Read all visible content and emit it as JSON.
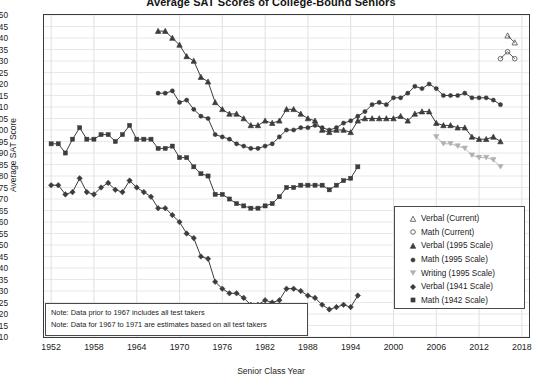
{
  "chart_data": {
    "type": "line",
    "title": "Average SAT Scores of College-Bound Seniors",
    "xlabel": "Senior Class Year",
    "ylabel": "Average SAT Score",
    "xlim": [
      1951,
      2019
    ],
    "ylim": [
      410,
      550
    ],
    "ytick_step": 5,
    "xtick_step": 6,
    "grid": true,
    "legend_position": "right-center",
    "xticks": [
      "1952",
      "1958",
      "1964",
      "1970",
      "1976",
      "1982",
      "1988",
      "1994",
      "2000",
      "2006",
      "2012",
      "2018"
    ],
    "yticks": [
      "550",
      "545",
      "540",
      "535",
      "530",
      "525",
      "520",
      "515",
      "510",
      "505",
      "500",
      "495",
      "490",
      "485",
      "480",
      "475",
      "470",
      "465",
      "460",
      "455",
      "450",
      "445",
      "440",
      "435",
      "430",
      "425",
      "420",
      "415",
      "410"
    ],
    "notes": [
      "Note: Data prior to 1967 includes all test takers",
      "Note: Data for 1967 to 1971 are estimates based on all test takers"
    ],
    "series": [
      {
        "name": "Verbal (Current)",
        "marker": "triangle-open",
        "color": "#5a5a5a",
        "x": [
          2016,
          2017
        ],
        "values": [
          541,
          538
        ]
      },
      {
        "name": "Math (Current)",
        "marker": "circle-open",
        "color": "#5a5a5a",
        "x": [
          2015,
          2016,
          2017
        ],
        "values": [
          531,
          534,
          531
        ]
      },
      {
        "name": "Verbal (1995 Scale)",
        "marker": "triangle-filled",
        "color": "#3c3c3c",
        "x": [
          1967,
          1968,
          1969,
          1970,
          1971,
          1972,
          1973,
          1974,
          1975,
          1976,
          1977,
          1978,
          1979,
          1980,
          1981,
          1982,
          1983,
          1984,
          1985,
          1986,
          1987,
          1988,
          1989,
          1990,
          1991,
          1992,
          1993,
          1994,
          1995,
          1996,
          1997,
          1998,
          1999,
          2000,
          2001,
          2002,
          2003,
          2004,
          2005,
          2006,
          2007,
          2008,
          2009,
          2010,
          2011,
          2012,
          2013,
          2014,
          2015
        ],
        "values": [
          543,
          543,
          540,
          537,
          532,
          530,
          523,
          521,
          512,
          509,
          507,
          507,
          505,
          502,
          502,
          504,
          503,
          504,
          509,
          509,
          507,
          505,
          504,
          500,
          499,
          500,
          500,
          499,
          504,
          505,
          505,
          505,
          505,
          505,
          506,
          504,
          507,
          508,
          508,
          503,
          502,
          502,
          501,
          501,
          497,
          496,
          496,
          497,
          495
        ]
      },
      {
        "name": "Math (1995 Scale)",
        "marker": "circle-filled",
        "color": "#3c3c3c",
        "x": [
          1967,
          1968,
          1969,
          1970,
          1971,
          1972,
          1973,
          1974,
          1975,
          1976,
          1977,
          1978,
          1979,
          1980,
          1981,
          1982,
          1983,
          1984,
          1985,
          1986,
          1987,
          1988,
          1989,
          1990,
          1991,
          1992,
          1993,
          1994,
          1995,
          1996,
          1997,
          1998,
          1999,
          2000,
          2001,
          2002,
          2003,
          2004,
          2005,
          2006,
          2007,
          2008,
          2009,
          2010,
          2011,
          2012,
          2013,
          2014,
          2015
        ],
        "values": [
          516,
          516,
          517,
          512,
          513,
          509,
          506,
          505,
          498,
          497,
          496,
          494,
          493,
          492,
          492,
          493,
          494,
          497,
          500,
          500,
          501,
          501,
          502,
          501,
          500,
          501,
          503,
          504,
          506,
          508,
          511,
          512,
          511,
          514,
          514,
          516,
          519,
          518,
          520,
          518,
          515,
          515,
          515,
          516,
          514,
          514,
          514,
          513,
          511
        ]
      },
      {
        "name": "Writing (1995 Scale)",
        "marker": "triangle-down-light",
        "color": "#b0b0b0",
        "x": [
          2006,
          2007,
          2008,
          2009,
          2010,
          2011,
          2012,
          2013,
          2014,
          2015
        ],
        "values": [
          497,
          494,
          494,
          493,
          492,
          489,
          488,
          488,
          487,
          484
        ]
      },
      {
        "name": "Verbal (1941 Scale)",
        "marker": "diamond-filled",
        "color": "#3c3c3c",
        "x": [
          1952,
          1953,
          1954,
          1955,
          1956,
          1957,
          1958,
          1959,
          1960,
          1961,
          1962,
          1963,
          1964,
          1965,
          1966,
          1967,
          1968,
          1969,
          1970,
          1971,
          1972,
          1973,
          1974,
          1975,
          1976,
          1977,
          1978,
          1979,
          1980,
          1981,
          1982,
          1983,
          1984,
          1985,
          1986,
          1987,
          1988,
          1989,
          1990,
          1991,
          1992,
          1993,
          1994,
          1995
        ],
        "values": [
          476,
          476,
          472,
          473,
          479,
          473,
          472,
          475,
          477,
          474,
          473,
          478,
          475,
          473,
          471,
          466,
          466,
          463,
          460,
          455,
          453,
          445,
          444,
          434,
          431,
          429,
          429,
          427,
          424,
          424,
          426,
          425,
          426,
          431,
          431,
          430,
          428,
          427,
          424,
          422,
          423,
          424,
          423,
          428
        ]
      },
      {
        "name": "Math (1942 Scale)",
        "marker": "square-filled",
        "color": "#3c3c3c",
        "x": [
          1952,
          1953,
          1954,
          1955,
          1956,
          1957,
          1958,
          1959,
          1960,
          1961,
          1962,
          1963,
          1964,
          1965,
          1966,
          1967,
          1968,
          1969,
          1970,
          1971,
          1972,
          1973,
          1974,
          1975,
          1976,
          1977,
          1978,
          1979,
          1980,
          1981,
          1982,
          1983,
          1984,
          1985,
          1986,
          1987,
          1988,
          1989,
          1990,
          1991,
          1992,
          1993,
          1994,
          1995
        ],
        "values": [
          494,
          494,
          490,
          496,
          501,
          496,
          496,
          498,
          498,
          495,
          498,
          502,
          496,
          496,
          496,
          492,
          492,
          493,
          488,
          488,
          484,
          481,
          480,
          472,
          472,
          470,
          468,
          467,
          466,
          466,
          467,
          468,
          471,
          475,
          475,
          476,
          476,
          476,
          476,
          474,
          476,
          478,
          479,
          484
        ]
      }
    ]
  }
}
